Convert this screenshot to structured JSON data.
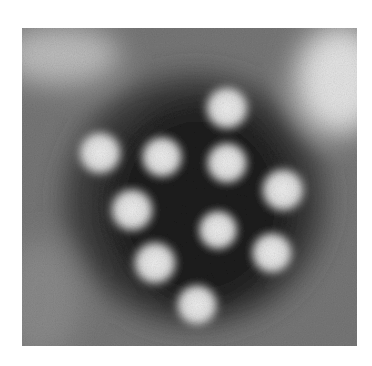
{
  "image": {
    "kind": "electron-micrograph",
    "subject": "cluster of icosahedral virus particles, negative stain",
    "frame": {
      "x": 22,
      "y": 28,
      "width": 335,
      "height": 318
    },
    "colors": {
      "background": "#ffffff",
      "stain_dark": "#1a1a1a",
      "stain_mid": "#6b6b6b",
      "stain_light": "#d8d8d8",
      "particle": "#e6e6e6"
    },
    "particles": [
      {
        "cx": 227,
        "cy": 108,
        "r": 24
      },
      {
        "cx": 100,
        "cy": 153,
        "r": 24
      },
      {
        "cx": 162,
        "cy": 157,
        "r": 23
      },
      {
        "cx": 227,
        "cy": 163,
        "r": 23
      },
      {
        "cx": 283,
        "cy": 190,
        "r": 24
      },
      {
        "cx": 132,
        "cy": 210,
        "r": 24
      },
      {
        "cx": 218,
        "cy": 230,
        "r": 22
      },
      {
        "cx": 155,
        "cy": 263,
        "r": 24
      },
      {
        "cx": 272,
        "cy": 253,
        "r": 23
      },
      {
        "cx": 197,
        "cy": 305,
        "r": 23
      }
    ]
  }
}
